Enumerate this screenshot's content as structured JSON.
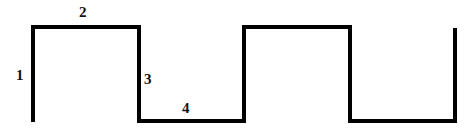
{
  "diagram": {
    "type": "square-wave",
    "stroke_color": "#000000",
    "background": "#ffffff",
    "path_points": [
      [
        33,
        122
      ],
      [
        33,
        27
      ],
      [
        139,
        27
      ],
      [
        139,
        121
      ],
      [
        244,
        121
      ],
      [
        244,
        27
      ],
      [
        350,
        27
      ],
      [
        350,
        121
      ],
      [
        455,
        121
      ],
      [
        455,
        28
      ]
    ],
    "labels": [
      {
        "text": "1",
        "x": 16,
        "y": 80
      },
      {
        "text": "2",
        "x": 79,
        "y": 17
      },
      {
        "text": "3",
        "x": 144,
        "y": 84
      },
      {
        "text": "4",
        "x": 182,
        "y": 113
      }
    ]
  }
}
